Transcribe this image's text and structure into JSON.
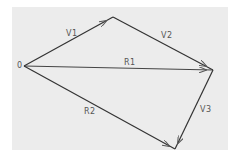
{
  "diagram": {
    "title": "",
    "type": "vector-addition",
    "colors": {
      "background": "#ececec",
      "line": "#333333",
      "label": "#555555"
    },
    "points": {
      "origin": {
        "label": "0",
        "x": 24,
        "y": 66
      },
      "A": {
        "x": 113,
        "y": 17
      },
      "B": {
        "x": 213,
        "y": 70
      },
      "C": {
        "x": 175,
        "y": 149
      }
    },
    "vectors": [
      {
        "name": "V1",
        "label": "V1",
        "from": "origin",
        "to": "A"
      },
      {
        "name": "V2",
        "label": "V2",
        "from": "A",
        "to": "B"
      },
      {
        "name": "R1",
        "label": "R1",
        "from": "origin",
        "to": "B"
      },
      {
        "name": "V3",
        "label": "V3",
        "from": "B",
        "to": "C"
      },
      {
        "name": "R2",
        "label": "R2",
        "from": "origin",
        "to": "C"
      }
    ]
  }
}
